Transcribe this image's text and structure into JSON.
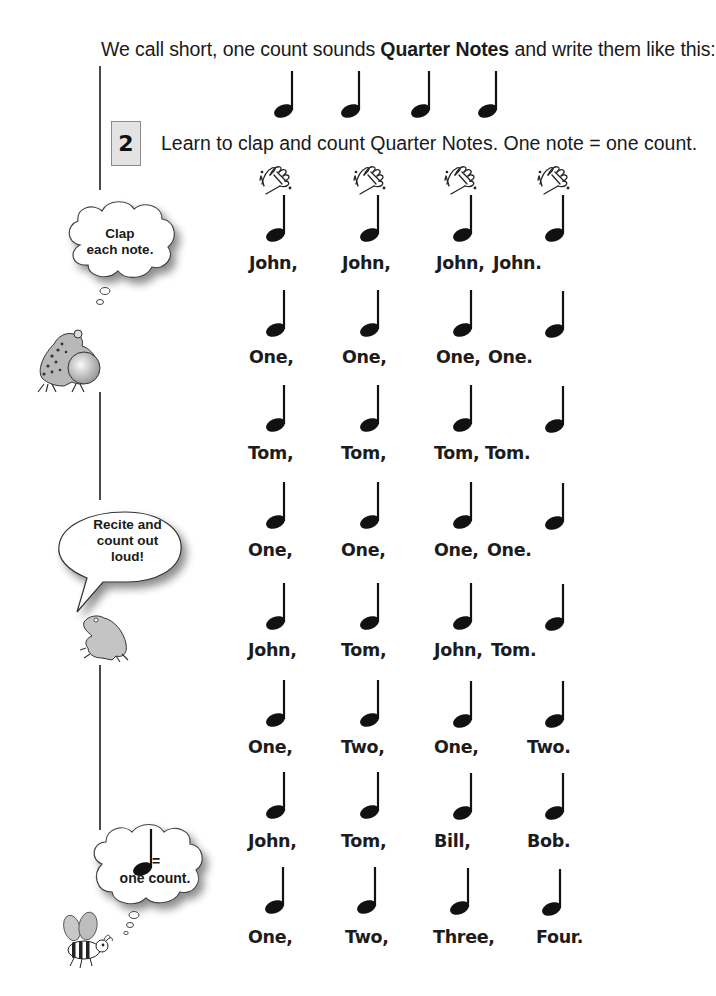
{
  "page": {
    "intro": {
      "before": "We call short, one count sounds ",
      "bold": "Quarter Notes",
      "after": " and write them like this:"
    },
    "step": {
      "number": "2",
      "instruction": "Learn to clap and count Quarter Notes. One note = one count."
    },
    "icons": {
      "note": "quarter-note-icon",
      "clap": "clapping-hands-icon"
    },
    "sidebar": {
      "bubble1": {
        "line1": "Clap",
        "line2": "each note."
      },
      "bubble2": {
        "line1": "Recite and",
        "line2": "count out",
        "line3": "loud!"
      },
      "bubble3": {
        "symbol": "=",
        "text": "one count."
      }
    },
    "rows": [
      {
        "words": [
          "John,",
          "John,",
          "John,",
          "John."
        ]
      },
      {
        "words": [
          "One,",
          "One,",
          "One,",
          "One."
        ]
      },
      {
        "words": [
          "Tom,",
          "Tom,",
          "Tom,",
          "Tom."
        ]
      },
      {
        "words": [
          "One,",
          "One,",
          "One,",
          "One."
        ]
      },
      {
        "words": [
          "John,",
          "Tom,",
          "John,",
          "Tom."
        ]
      },
      {
        "words": [
          "One,",
          "Two,",
          "One,",
          "Two."
        ]
      },
      {
        "words": [
          "John,",
          "Tom,",
          "Bill,",
          "Bob."
        ]
      },
      {
        "words": [
          "One,",
          "Two,",
          "Three,",
          "Four."
        ]
      }
    ]
  }
}
